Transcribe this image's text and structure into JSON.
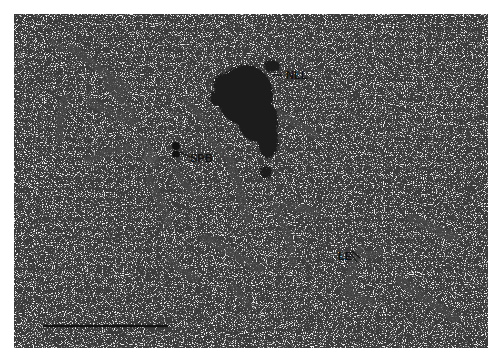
{
  "figure": {
    "type": "electron-micrograph",
    "panel": {
      "x": 14,
      "y": 14,
      "width": 474,
      "height": 334,
      "background": "#efefef"
    },
    "labels": [
      {
        "id": "nll",
        "text": "NLL",
        "x": 286,
        "y": 79,
        "pointer": [
          [
            273,
            75
          ],
          [
            282,
            75
          ]
        ]
      },
      {
        "id": "spb",
        "text": "SPB",
        "x": 189,
        "y": 159,
        "pointer": [
          [
            180,
            152
          ],
          [
            190,
            156
          ]
        ]
      },
      {
        "id": "le",
        "text": "LE",
        "x": 338,
        "y": 260,
        "pointer": [
          [
            350,
            253
          ],
          [
            358,
            265
          ]
        ]
      }
    ],
    "scale_bar": {
      "x1": 43,
      "x2": 168,
      "y": 326,
      "color": "#111111"
    },
    "colors": {
      "speckle": "#2a2a2a",
      "chromosome": "#555555",
      "nll": "#1a1a1a"
    }
  }
}
